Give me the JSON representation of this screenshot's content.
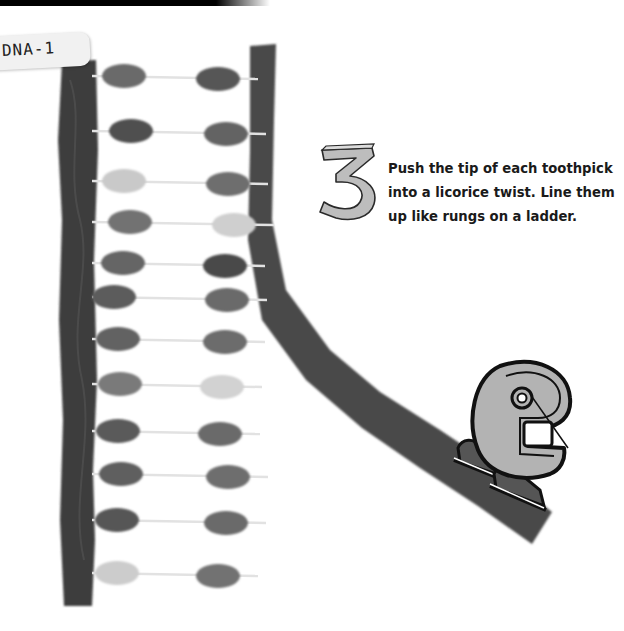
{
  "label": {
    "text": "DNA-1"
  },
  "step": {
    "number": "3",
    "lines": [
      "Push the tip of each toothpick",
      "into a licorice twist. Line them",
      "up like rungs on a ladder."
    ]
  },
  "colors": {
    "licorice": "#3d3d3d",
    "licorice_right": "#4a4a4a",
    "toothpick": "#e2e2e2",
    "mascot_fill": "#b3b3b3",
    "mascot_outline": "#111111",
    "skate": "#555555"
  },
  "rungs": [
    {
      "y": 76,
      "left": {
        "x": 124,
        "shade": "#6a6a6a"
      },
      "right": {
        "x": 218,
        "shade": "#575757"
      }
    },
    {
      "y": 131,
      "left": {
        "x": 131,
        "shade": "#4f4f4f"
      },
      "right": {
        "x": 226,
        "shade": "#646464"
      }
    },
    {
      "y": 181,
      "left": {
        "x": 124,
        "shade": "#c9c9c9"
      },
      "right": {
        "x": 228,
        "shade": "#6e6e6e"
      }
    },
    {
      "y": 222,
      "left": {
        "x": 130,
        "shade": "#727272"
      },
      "right": {
        "x": 234,
        "shade": "#cfcfcf"
      }
    },
    {
      "y": 263,
      "left": {
        "x": 123,
        "shade": "#656565"
      },
      "right": {
        "x": 225,
        "shade": "#4a4a4a"
      }
    },
    {
      "y": 297,
      "left": {
        "x": 114,
        "shade": "#5c5c5c"
      },
      "right": {
        "x": 227,
        "shade": "#6a6a6a"
      }
    },
    {
      "y": 339,
      "left": {
        "x": 118,
        "shade": "#626262"
      },
      "right": {
        "x": 225,
        "shade": "#6c6c6c"
      }
    },
    {
      "y": 384,
      "left": {
        "x": 120,
        "shade": "#7a7a7a"
      },
      "right": {
        "x": 222,
        "shade": "#d2d2d2"
      }
    },
    {
      "y": 431,
      "left": {
        "x": 118,
        "shade": "#5a5a5a"
      },
      "right": {
        "x": 220,
        "shade": "#6a6a6a"
      }
    },
    {
      "y": 474,
      "left": {
        "x": 121,
        "shade": "#5e5e5e"
      },
      "right": {
        "x": 228,
        "shade": "#6e6e6e"
      }
    },
    {
      "y": 520,
      "left": {
        "x": 117,
        "shade": "#575757"
      },
      "right": {
        "x": 226,
        "shade": "#6a6a6a"
      }
    },
    {
      "y": 573,
      "left": {
        "x": 117,
        "shade": "#cccccc"
      },
      "right": {
        "x": 218,
        "shade": "#727272"
      }
    }
  ]
}
